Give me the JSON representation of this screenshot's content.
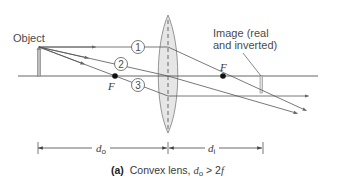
{
  "figure": {
    "caption": {
      "tag": "(a)",
      "text": "Convex lens, ",
      "var": "d",
      "var_sub": "o",
      "relation": " > 2",
      "relation_var": "f"
    },
    "labels": {
      "object": "Object",
      "image_line1": "Image (real",
      "image_line2": "and inverted)",
      "focal_left": "F",
      "focal_right": "F"
    },
    "rays": [
      {
        "id": "1",
        "label": "1"
      },
      {
        "id": "2",
        "label": "2"
      },
      {
        "id": "3",
        "label": "3"
      }
    ],
    "dimensions": {
      "object_distance": {
        "var": "d",
        "sub": "o"
      },
      "image_distance": {
        "var": "d",
        "sub": "i"
      }
    },
    "colors": {
      "line": "#555555",
      "lens_fill": "#e6e6e6",
      "lens_stroke": "#8a8a8a",
      "text": "#444444",
      "focal_dot": "#111111"
    }
  }
}
